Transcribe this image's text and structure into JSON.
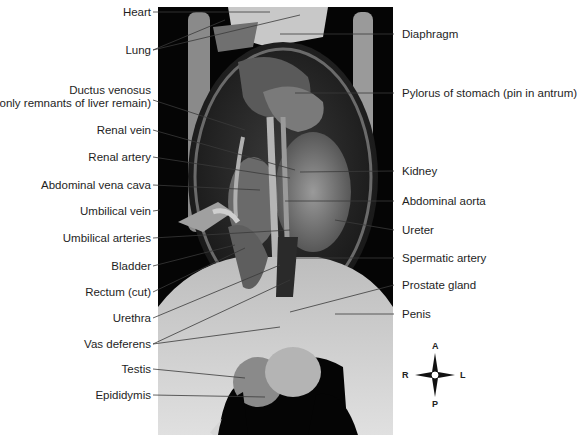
{
  "figure": {
    "colors": {
      "background": "#ffffff",
      "photo_background": "#050505",
      "leader_lines": "#444444",
      "text": "#1e1e1e"
    }
  },
  "labels_left": [
    {
      "id": "heart",
      "text": "Heart"
    },
    {
      "id": "lung",
      "text": "Lung"
    },
    {
      "id": "ductus-venosus",
      "text": "Ductus venosus",
      "text2": "(only remnants of liver remain)"
    },
    {
      "id": "renal-vein",
      "text": "Renal vein"
    },
    {
      "id": "renal-artery",
      "text": "Renal artery"
    },
    {
      "id": "abdominal-vena-cava",
      "text": "Abdominal vena cava"
    },
    {
      "id": "umbilical-vein",
      "text": "Umbilical vein"
    },
    {
      "id": "umbilical-arteries",
      "text": "Umbilical arteries"
    },
    {
      "id": "bladder",
      "text": "Bladder"
    },
    {
      "id": "rectum",
      "text": "Rectum (cut)"
    },
    {
      "id": "urethra",
      "text": "Urethra"
    },
    {
      "id": "vas-deferens",
      "text": "Vas deferens"
    },
    {
      "id": "testis",
      "text": "Testis"
    },
    {
      "id": "epididymis",
      "text": "Epididymis"
    }
  ],
  "labels_right": [
    {
      "id": "diaphragm",
      "text": "Diaphragm"
    },
    {
      "id": "pylorus",
      "text": "Pylorus of stomach (pin in antrum)"
    },
    {
      "id": "kidney",
      "text": "Kidney"
    },
    {
      "id": "abdominal-aorta",
      "text": "Abdominal aorta"
    },
    {
      "id": "ureter",
      "text": "Ureter"
    },
    {
      "id": "spermatic-artery",
      "text": "Spermatic artery"
    },
    {
      "id": "prostate-gland",
      "text": "Prostate gland"
    },
    {
      "id": "penis",
      "text": "Penis"
    }
  ],
  "compass": {
    "icon": "orientation-compass-icon",
    "anterior": "A",
    "posterior": "P",
    "right": "R",
    "left": "L"
  }
}
